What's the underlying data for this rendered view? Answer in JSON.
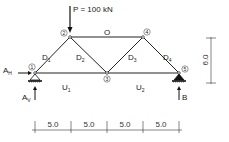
{
  "diagram": {
    "type": "truss",
    "load": {
      "label": "P = 100 kN",
      "node": 2
    },
    "nodes": [
      {
        "id": "1",
        "label": "1",
        "x": 35,
        "y": 73
      },
      {
        "id": "2",
        "label": "2",
        "x": 70,
        "y": 37
      },
      {
        "id": "3",
        "label": "3",
        "x": 107,
        "y": 73
      },
      {
        "id": "4",
        "label": "4",
        "x": 143,
        "y": 37
      },
      {
        "id": "5",
        "label": "5",
        "x": 179,
        "y": 73
      }
    ],
    "members": {
      "D1": "D",
      "D1_sub": "1",
      "D2": "D",
      "D2_sub": "2",
      "D3": "D",
      "D3_sub": "3",
      "D4": "D",
      "D4_sub": "4",
      "O": "O",
      "U1": "U",
      "U1_sub": "1",
      "U2": "U",
      "U2_sub": "2"
    },
    "reactions": {
      "AH": "A",
      "AH_sub": "H",
      "AV": "A",
      "AV_sub": "V",
      "B": "B"
    },
    "dimensions": {
      "height": "6.0",
      "spans": [
        "5.0",
        "5.0",
        "5.0",
        "5.0"
      ]
    }
  }
}
